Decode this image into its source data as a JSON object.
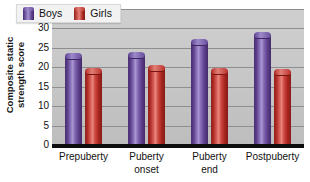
{
  "chart_data": {
    "type": "bar",
    "title": "",
    "subtitle": "",
    "xlabel": "",
    "ylabel": "Composite static strength score",
    "ylabel_lines": [
      "Composite static",
      "strength score"
    ],
    "categories": [
      "Prepuberty",
      "Puberty onset",
      "Puberty end",
      "Postpuberty"
    ],
    "category_lines": [
      [
        "Prepuberty"
      ],
      [
        "Puberty",
        "onset"
      ],
      [
        "Puberty",
        "end"
      ],
      [
        "Postpuberty"
      ]
    ],
    "series": [
      {
        "name": "Boys",
        "color": "#6b4e9e",
        "values": [
          23.8,
          23.9,
          27.3,
          29.2
        ]
      },
      {
        "name": "Girls",
        "color": "#c8332e",
        "values": [
          19.7,
          20.7,
          19.7,
          19.5
        ]
      }
    ],
    "ylim": [
      0,
      35
    ],
    "ytick_values": [
      0,
      5,
      10,
      15,
      20,
      25,
      30,
      35
    ],
    "ytick_labels": [
      "0",
      "5",
      "10",
      "15",
      "20",
      "25",
      "30",
      "35"
    ],
    "grid": true,
    "grid_axis": "y",
    "legend": {
      "position": "top-left-inside",
      "entries": [
        {
          "label": "Boys",
          "color": "#6b4e9e"
        },
        {
          "label": "Girls",
          "color": "#c8332e"
        }
      ]
    },
    "style": {
      "plot_background": "#c6c6c6",
      "gridline_color": "#8e8e8e",
      "baseline_color": "#0d0d0d",
      "figure_background": "#ffffff",
      "bar_shape": "cylinder"
    }
  }
}
